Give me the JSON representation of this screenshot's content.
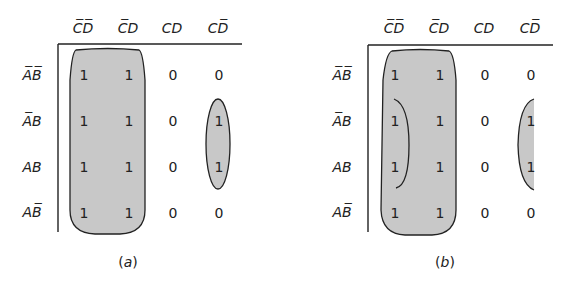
{
  "columns": [
    {
      "label": "CD",
      "bars": [
        true,
        true
      ]
    },
    {
      "label": "CD",
      "bars": [
        true,
        false
      ]
    },
    {
      "label": "CD",
      "bars": [
        false,
        false
      ]
    },
    {
      "label": "CD",
      "bars": [
        false,
        true
      ]
    }
  ],
  "column_text": [
    "C̅D̅",
    "C̅D",
    "CD",
    "CD̅"
  ],
  "row_text": [
    "A̅B̅",
    "A̅B",
    "AB",
    "AB̅"
  ],
  "maps": [
    {
      "caption_letter": "a",
      "values": [
        [
          "1",
          "1",
          "0",
          "0"
        ],
        [
          "1",
          "1",
          "0",
          "1"
        ],
        [
          "1",
          "1",
          "0",
          "1"
        ],
        [
          "1",
          "1",
          "0",
          "0"
        ]
      ],
      "groups": [
        "columns 1-2 (all rows)",
        "column 4 rows 2-3"
      ]
    },
    {
      "caption_letter": "b",
      "values": [
        [
          "1",
          "1",
          "0",
          "0"
        ],
        [
          "1",
          "1",
          "0",
          "1"
        ],
        [
          "1",
          "1",
          "0",
          "1"
        ],
        [
          "1",
          "1",
          "0",
          "0"
        ]
      ],
      "groups": [
        "columns 1-2 (all rows)",
        "column 1 rows 2-3 (wraps)",
        "column 4 rows 2-3 (wraps)"
      ]
    }
  ],
  "colors": {
    "fill": "#c8c8c8",
    "line": "#222222"
  }
}
